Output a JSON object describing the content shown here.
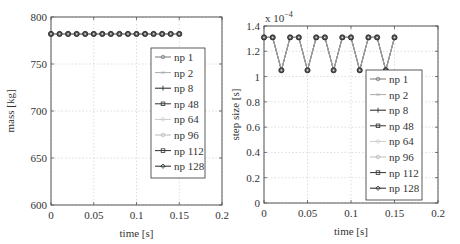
{
  "chart_data": [
    {
      "type": "line",
      "title": "",
      "xlabel": "time [s]",
      "ylabel": "mass [kg]",
      "xlim": [
        0,
        0.2
      ],
      "ylim": [
        600,
        800
      ],
      "xticks": [
        "0",
        "0.05",
        "0.1",
        "0.15",
        "0.2"
      ],
      "yticks": [
        "600",
        "650",
        "700",
        "750",
        "800"
      ],
      "grid": true,
      "legend_position": "right-inside",
      "x": [
        0,
        0.01,
        0.02,
        0.03,
        0.04,
        0.05,
        0.06,
        0.07,
        0.08,
        0.09,
        0.1,
        0.11,
        0.12,
        0.13,
        0.14,
        0.15
      ],
      "series": [
        {
          "name": "np 1",
          "values": [
            782,
            782,
            782,
            782,
            782,
            782,
            782,
            782,
            782,
            782,
            782,
            782,
            782,
            782,
            782,
            782
          ]
        },
        {
          "name": "np 2",
          "values": [
            782,
            782,
            782,
            782,
            782,
            782,
            782,
            782,
            782,
            782,
            782,
            782,
            782,
            782,
            782,
            782
          ]
        },
        {
          "name": "np 8",
          "values": [
            782,
            782,
            782,
            782,
            782,
            782,
            782,
            782,
            782,
            782,
            782,
            782,
            782,
            782,
            782,
            782
          ]
        },
        {
          "name": "np 48",
          "values": [
            782,
            782,
            782,
            782,
            782,
            782,
            782,
            782,
            782,
            782,
            782,
            782,
            782,
            782,
            782,
            782
          ]
        },
        {
          "name": "np 64",
          "values": [
            782,
            782,
            782,
            782,
            782,
            782,
            782,
            782,
            782,
            782,
            782,
            782,
            782,
            782,
            782,
            782
          ]
        },
        {
          "name": "np 96",
          "values": [
            782,
            782,
            782,
            782,
            782,
            782,
            782,
            782,
            782,
            782,
            782,
            782,
            782,
            782,
            782,
            782
          ]
        },
        {
          "name": "np 112",
          "values": [
            782,
            782,
            782,
            782,
            782,
            782,
            782,
            782,
            782,
            782,
            782,
            782,
            782,
            782,
            782,
            782
          ]
        },
        {
          "name": "np 128",
          "values": [
            782,
            782,
            782,
            782,
            782,
            782,
            782,
            782,
            782,
            782,
            782,
            782,
            782,
            782,
            782,
            782
          ]
        }
      ]
    },
    {
      "type": "line",
      "title": "",
      "xlabel": "time [s]",
      "ylabel": "step size [s]",
      "y_multiplier": "x 10^-4",
      "xlim": [
        0,
        0.2
      ],
      "ylim": [
        0,
        1.4
      ],
      "xticks": [
        "0",
        "0.05",
        "0.1",
        "0.15",
        "0.2"
      ],
      "yticks": [
        "0",
        "0.2",
        "0.4",
        "0.6",
        "0.8",
        "1",
        "1.2",
        "1.4"
      ],
      "grid": true,
      "legend_position": "right-inside",
      "x": [
        0,
        0.01,
        0.02,
        0.03,
        0.04,
        0.05,
        0.06,
        0.07,
        0.08,
        0.09,
        0.1,
        0.11,
        0.12,
        0.13,
        0.14,
        0.15
      ],
      "series": [
        {
          "name": "np 1",
          "values": [
            1.31,
            1.31,
            1.05,
            1.31,
            1.31,
            1.05,
            1.31,
            1.31,
            1.05,
            1.31,
            1.31,
            1.05,
            1.31,
            1.31,
            1.05,
            1.31
          ]
        },
        {
          "name": "np 2",
          "values": [
            1.31,
            1.31,
            1.05,
            1.31,
            1.31,
            1.05,
            1.31,
            1.31,
            1.05,
            1.31,
            1.31,
            1.05,
            1.31,
            1.31,
            1.05,
            1.31
          ]
        },
        {
          "name": "np 8",
          "values": [
            1.31,
            1.31,
            1.05,
            1.31,
            1.31,
            1.05,
            1.31,
            1.31,
            1.05,
            1.31,
            1.31,
            1.05,
            1.31,
            1.31,
            1.05,
            1.31
          ]
        },
        {
          "name": "np 48",
          "values": [
            1.31,
            1.31,
            1.05,
            1.31,
            1.31,
            1.05,
            1.31,
            1.31,
            1.05,
            1.31,
            1.31,
            1.05,
            1.31,
            1.31,
            1.05,
            1.31
          ]
        },
        {
          "name": "np 64",
          "values": [
            1.31,
            1.31,
            1.05,
            1.31,
            1.31,
            1.05,
            1.31,
            1.31,
            1.05,
            1.31,
            1.31,
            1.05,
            1.31,
            1.31,
            1.05,
            1.31
          ]
        },
        {
          "name": "np 96",
          "values": [
            1.31,
            1.31,
            1.05,
            1.31,
            1.31,
            1.05,
            1.31,
            1.31,
            1.05,
            1.31,
            1.31,
            1.05,
            1.31,
            1.31,
            1.05,
            1.31
          ]
        },
        {
          "name": "np 112",
          "values": [
            1.31,
            1.31,
            1.05,
            1.31,
            1.31,
            1.05,
            1.31,
            1.31,
            1.05,
            1.31,
            1.31,
            1.05,
            1.31,
            1.31,
            1.05,
            1.31
          ]
        },
        {
          "name": "np 128",
          "values": [
            1.31,
            1.31,
            1.05,
            1.31,
            1.31,
            1.05,
            1.31,
            1.31,
            1.05,
            1.31,
            1.31,
            1.05,
            1.31,
            1.31,
            1.05,
            1.31
          ]
        }
      ]
    }
  ],
  "legend": {
    "entries": [
      {
        "label": "np 1",
        "color": "#777777",
        "marker": "circle"
      },
      {
        "label": "np 2",
        "color": "#aaaaaa",
        "marker": "star"
      },
      {
        "label": "np 8",
        "color": "#222222",
        "marker": "plus"
      },
      {
        "label": "np 48",
        "color": "#333333",
        "marker": "square"
      },
      {
        "label": "np 64",
        "color": "#cccccc",
        "marker": "diamond"
      },
      {
        "label": "np 96",
        "color": "#bbbbbb",
        "marker": "circle"
      },
      {
        "label": "np 112",
        "color": "#333333",
        "marker": "square"
      },
      {
        "label": "np 128",
        "color": "#222222",
        "marker": "diamond"
      }
    ]
  },
  "colors": {
    "axis": "#555555",
    "grid": "#cfcfcf",
    "marker": "#333333",
    "line": "#999999"
  }
}
